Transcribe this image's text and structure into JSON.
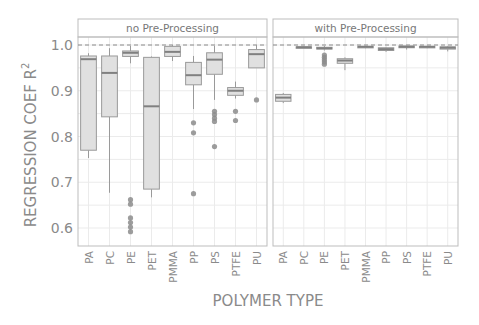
{
  "chart_data": {
    "type": "box",
    "title": "",
    "xlabel": "POLYMER TYPE",
    "ylabel": "REGRESSION COEF R",
    "ylabel_superscript": "2",
    "ylim": [
      0.565,
      1.04
    ],
    "yticks": [
      0.6,
      0.7,
      0.8,
      0.9,
      1.0
    ],
    "ytick_labels": [
      "0.6",
      "0.7",
      "0.8",
      "0.9",
      "1.0"
    ],
    "reference_line": {
      "y": 1.0,
      "style": "dashed"
    },
    "grid": true,
    "categories": [
      "PA",
      "PC",
      "PE",
      "PET",
      "PMMA",
      "PP",
      "PS",
      "PTFE",
      "PU"
    ],
    "panels": [
      {
        "name": "no Pre-Processing",
        "boxes": [
          {
            "category": "PA",
            "whisker_low": 0.753,
            "q1": 0.77,
            "median": 0.969,
            "q3": 0.976,
            "whisker_high": 0.982,
            "outliers": []
          },
          {
            "category": "PC",
            "whisker_low": 0.677,
            "q1": 0.843,
            "median": 0.939,
            "q3": 0.976,
            "whisker_high": 0.993,
            "outliers": []
          },
          {
            "category": "PE",
            "whisker_low": 0.96,
            "q1": 0.975,
            "median": 0.983,
            "q3": 0.987,
            "whisker_high": 0.998,
            "outliers": [
              0.662,
              0.652,
              0.622,
              0.612,
              0.602,
              0.592
            ]
          },
          {
            "category": "PET",
            "whisker_low": 0.667,
            "q1": 0.685,
            "median": 0.866,
            "q3": 0.973,
            "whisker_high": 0.975,
            "outliers": []
          },
          {
            "category": "PMMA",
            "whisker_low": 0.965,
            "q1": 0.975,
            "median": 0.985,
            "q3": 0.997,
            "whisker_high": 1.0,
            "outliers": []
          },
          {
            "category": "PP",
            "whisker_low": 0.86,
            "q1": 0.913,
            "median": 0.934,
            "q3": 0.962,
            "whisker_high": 0.976,
            "outliers": [
              0.83,
              0.808,
              0.675
            ]
          },
          {
            "category": "PS",
            "whisker_low": 0.88,
            "q1": 0.936,
            "median": 0.968,
            "q3": 0.983,
            "whisker_high": 0.998,
            "outliers": [
              0.855,
              0.848,
              0.84,
              0.833,
              0.778
            ]
          },
          {
            "category": "PTFE",
            "whisker_low": 0.883,
            "q1": 0.89,
            "median": 0.9,
            "q3": 0.907,
            "whisker_high": 0.92,
            "outliers": [
              0.855,
              0.835
            ]
          },
          {
            "category": "PU",
            "whisker_low": 0.95,
            "q1": 0.95,
            "median": 0.98,
            "q3": 0.99,
            "whisker_high": 1.0,
            "outliers": [
              0.88
            ]
          }
        ]
      },
      {
        "name": "with Pre-Processing",
        "boxes": [
          {
            "category": "PA",
            "whisker_low": 0.873,
            "q1": 0.877,
            "median": 0.885,
            "q3": 0.892,
            "whisker_high": 0.895,
            "outliers": []
          },
          {
            "category": "PC",
            "whisker_low": 0.993,
            "q1": 0.994,
            "median": 0.995,
            "q3": 0.996,
            "whisker_high": 0.997,
            "outliers": []
          },
          {
            "category": "PE",
            "whisker_low": 0.988,
            "q1": 0.991,
            "median": 0.993,
            "q3": 0.995,
            "whisker_high": 0.998,
            "outliers": [
              0.978,
              0.973,
              0.968,
              0.963,
              0.958
            ]
          },
          {
            "category": "PET",
            "whisker_low": 0.945,
            "q1": 0.96,
            "median": 0.966,
            "q3": 0.97,
            "whisker_high": 0.973,
            "outliers": []
          },
          {
            "category": "PMMA",
            "whisker_low": 0.993,
            "q1": 0.995,
            "median": 0.996,
            "q3": 0.997,
            "whisker_high": 0.998,
            "outliers": []
          },
          {
            "category": "PP",
            "whisker_low": 0.985,
            "q1": 0.988,
            "median": 0.991,
            "q3": 0.994,
            "whisker_high": 0.996,
            "outliers": []
          },
          {
            "category": "PS",
            "whisker_low": 0.99,
            "q1": 0.994,
            "median": 0.996,
            "q3": 0.998,
            "whisker_high": 0.999,
            "outliers": []
          },
          {
            "category": "PTFE",
            "whisker_low": 0.993,
            "q1": 0.995,
            "median": 0.996,
            "q3": 0.997,
            "whisker_high": 0.998,
            "outliers": []
          },
          {
            "category": "PU",
            "whisker_low": 0.986,
            "q1": 0.991,
            "median": 0.994,
            "q3": 0.996,
            "whisker_high": 0.998,
            "outliers": []
          }
        ]
      }
    ],
    "colors": {
      "box_fill": "#e0e0e0",
      "box_stroke": "#9a9a9a",
      "median": "#808080",
      "outlier": "#8c8c8c",
      "grid": "#ebebeb",
      "panel_border": "#bdbdbd",
      "text": "#8a8a8a",
      "strip_text": "#777777"
    }
  }
}
